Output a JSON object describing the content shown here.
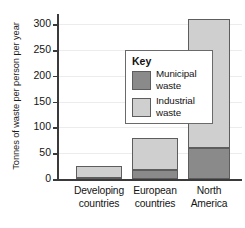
{
  "chart_data": {
    "type": "bar",
    "stacked": true,
    "title": "",
    "xlabel": "",
    "ylabel": "Tonnes of waste per person per year",
    "categories": [
      "Developing countries",
      "European countries",
      "North America"
    ],
    "category_lines": [
      [
        "Developing",
        "countries"
      ],
      [
        "European",
        "countries"
      ],
      [
        "North",
        "America"
      ]
    ],
    "series": [
      {
        "name": "Municipal waste",
        "values": [
          2,
          17,
          60
        ],
        "color": "#8a8a8a"
      },
      {
        "name": "Industrial waste",
        "values": [
          23,
          63,
          250
        ],
        "color": "#cfcfcf"
      }
    ],
    "totals": [
      25,
      80,
      310
    ],
    "ylim": [
      0,
      320
    ],
    "yticks": [
      0,
      50,
      100,
      150,
      200,
      250,
      300
    ],
    "ytick_labels": [
      "0",
      "50",
      "100",
      "150",
      "200",
      "250",
      "300"
    ],
    "grid": true,
    "legend_position": "inside-upper-left"
  },
  "legend": {
    "title": "Key",
    "entries": [
      {
        "label": "Municipal waste",
        "lines": [
          "Municipal",
          "waste"
        ],
        "color": "#8a8a8a"
      },
      {
        "label": "Industrial waste",
        "lines": [
          "Industrial",
          "waste"
        ],
        "color": "#cfcfcf"
      }
    ]
  },
  "axis": {
    "y_title": "Tonnes of waste per person per year"
  }
}
